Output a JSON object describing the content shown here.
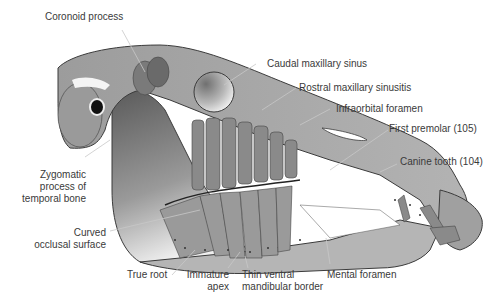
{
  "diagram": {
    "colors": {
      "bone": "#a9a9a9",
      "bone_light": "#cfcfcf",
      "bone_dark": "#6f6f6f",
      "outline": "#3b3b3b",
      "leader": "#c8c8c8",
      "label": "#3a3a3a",
      "cancellous": "#f2f2f2"
    },
    "labels": [
      {
        "id": "coronoid-process",
        "lines": [
          "Coronoid process"
        ]
      },
      {
        "id": "caudal-maxillary-sinus",
        "lines": [
          "Caudal maxillary sinus"
        ]
      },
      {
        "id": "rostral-maxillary-sinusitis",
        "lines": [
          "Rostral maxillary sinusitis"
        ]
      },
      {
        "id": "infraorbital-foramen",
        "lines": [
          "Infraorbital foramen"
        ]
      },
      {
        "id": "first-premolar",
        "lines": [
          "First premolar (105)"
        ]
      },
      {
        "id": "canine-tooth",
        "lines": [
          "Canine tooth (104)"
        ]
      },
      {
        "id": "zygomatic-process",
        "lines": [
          "Zygomatic",
          "process of",
          "temporal bone"
        ]
      },
      {
        "id": "curved-occlusal-surface",
        "lines": [
          "Curved",
          "occlusal surface"
        ]
      },
      {
        "id": "true-root",
        "lines": [
          "True root"
        ]
      },
      {
        "id": "immature-apex",
        "lines": [
          "Immature",
          "apex"
        ]
      },
      {
        "id": "thin-ventral-mandibular-border",
        "lines": [
          "Thin ventral",
          "mandibular border"
        ]
      },
      {
        "id": "mental-foramen",
        "lines": [
          "Mental foramen"
        ]
      }
    ]
  }
}
